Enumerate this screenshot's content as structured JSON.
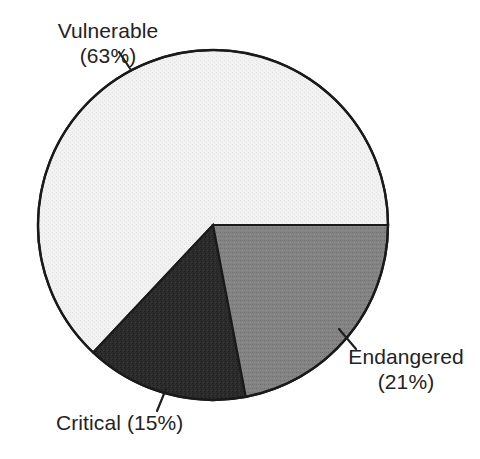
{
  "chart_data": {
    "type": "pie",
    "title": "",
    "subtitle": "",
    "xlabel": "",
    "ylabel": "",
    "grid": false,
    "legend_position": "none",
    "labels_position": "outside-with-leader-lines",
    "start_angle_deg": 0,
    "direction": "counterclockwise",
    "total_percent": 99,
    "categories": [
      "Vulnerable",
      "Endangered",
      "Critical"
    ],
    "values": [
      63,
      21,
      15
    ],
    "unit": "%",
    "slices": [
      {
        "name": "Vulnerable",
        "value": 63,
        "percent_text": "(63%)",
        "label_line1": "Vulnerable",
        "label_line2": "(63%)",
        "fill": "#efefef",
        "stroke": "#1a1a1a",
        "texture": "fine-light-stipple",
        "start_angle_deg": 0,
        "end_angle_deg": 226.8
      },
      {
        "name": "Critical",
        "value": 15,
        "percent_text": "(15%)",
        "label_line1": "Critical (15%)",
        "label_line2": "",
        "fill": "#2b2b2b",
        "stroke": "#1a1a1a",
        "texture": "dense-dark-stipple",
        "start_angle_deg": 226.8,
        "end_angle_deg": 280.8
      },
      {
        "name": "Endangered",
        "value": 21,
        "percent_text": "(21%)",
        "label_line1": "Endangered",
        "label_line2": "(21%)",
        "fill": "#808080",
        "stroke": "#1a1a1a",
        "texture": "medium-gray-halftone",
        "start_angle_deg": 280.8,
        "end_angle_deg": 360
      }
    ],
    "geometry": {
      "center_x": 213,
      "center_y": 225,
      "radius": 175
    },
    "colors": {
      "background": "#ffffff",
      "outline": "#1a1a1a",
      "text": "#232323",
      "vulnerable": "#efefef",
      "endangered": "#808080",
      "critical": "#2b2b2b"
    }
  },
  "labels": {
    "vulnerable": {
      "line1": "Vulnerable",
      "line2": "(63%)"
    },
    "endangered": {
      "line1": "Endangered",
      "line2": "(21%)"
    },
    "critical": {
      "line1": "Critical (15%)",
      "line2": ""
    }
  }
}
